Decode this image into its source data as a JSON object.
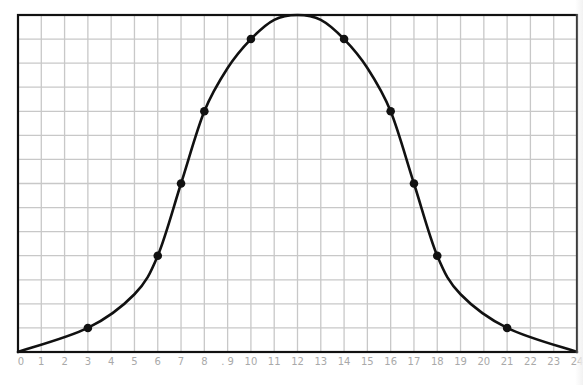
{
  "chart_data": {
    "type": "line",
    "title": "",
    "xlabel": "",
    "ylabel": "",
    "xlim": [
      0,
      24
    ],
    "ylim": [
      0,
      14
    ],
    "grid": true,
    "x_tick_labels": [
      "0",
      "1",
      "2",
      "3",
      "4",
      "5",
      "6",
      "7",
      "8",
      ". 9",
      "10",
      "11",
      "12",
      "13",
      "14",
      "15",
      "16",
      "17",
      "18",
      "19",
      "20",
      "21",
      "22",
      "23",
      "24"
    ],
    "y_tick_labels": [],
    "legend": [],
    "curve_shape": "bell curve (normal distribution), peak at x=12",
    "series": [
      {
        "name": "curve",
        "marked_points": [
          {
            "x": 3,
            "y": 1
          },
          {
            "x": 6,
            "y": 4
          },
          {
            "x": 7,
            "y": 7
          },
          {
            "x": 8,
            "y": 10
          },
          {
            "x": 10,
            "y": 13
          },
          {
            "x": 14,
            "y": 13
          },
          {
            "x": 16,
            "y": 10
          },
          {
            "x": 17,
            "y": 7
          },
          {
            "x": 18,
            "y": 4
          },
          {
            "x": 21,
            "y": 1
          }
        ],
        "curve_points": [
          {
            "x": 0,
            "y": 0
          },
          {
            "x": 3,
            "y": 1
          },
          {
            "x": 5,
            "y": 2.4
          },
          {
            "x": 6,
            "y": 4
          },
          {
            "x": 7,
            "y": 7
          },
          {
            "x": 8,
            "y": 10
          },
          {
            "x": 9,
            "y": 11.8
          },
          {
            "x": 10,
            "y": 13
          },
          {
            "x": 11,
            "y": 13.8
          },
          {
            "x": 12,
            "y": 14
          },
          {
            "x": 13,
            "y": 13.8
          },
          {
            "x": 14,
            "y": 13
          },
          {
            "x": 15,
            "y": 11.8
          },
          {
            "x": 16,
            "y": 10
          },
          {
            "x": 17,
            "y": 7
          },
          {
            "x": 18,
            "y": 4
          },
          {
            "x": 19,
            "y": 2.4
          },
          {
            "x": 21,
            "y": 1
          },
          {
            "x": 24,
            "y": 0
          }
        ]
      }
    ]
  },
  "colors": {
    "grid": "#c8c8c8",
    "frame": "#111111",
    "curve": "#111111",
    "tick_label": "#a9a9a9",
    "background": "#ffffff"
  }
}
